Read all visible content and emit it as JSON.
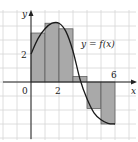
{
  "figure": {
    "curve_label": "y = f(x)",
    "x_axis_label": "x",
    "y_axis_label": "y",
    "origin_label": "0",
    "x_tick_labels": [
      {
        "value": 2,
        "text": "2"
      },
      {
        "value": 6,
        "text": "6"
      }
    ],
    "y_tick_labels": [
      {
        "value": 2,
        "text": "2"
      }
    ],
    "colors": {
      "grid": "#d6d6d6",
      "rect_fill": "#a9a9a9",
      "rect_stroke": "#555555",
      "curve": "#1a1a1a",
      "axis": "#222222"
    }
  },
  "chart_data": {
    "type": "area",
    "title": "",
    "xlabel": "x",
    "ylabel": "y",
    "xlim": [
      -2,
      7
    ],
    "ylim": [
      -4,
      5
    ],
    "grid": true,
    "grid_step": 1,
    "annotations": [
      {
        "text": "y = f(x)",
        "x": 3.5,
        "y": 2.8
      }
    ],
    "rectangles": [
      {
        "x0": 0,
        "x1": 1,
        "height": 3.5
      },
      {
        "x0": 1,
        "x1": 2,
        "height": 4.2
      },
      {
        "x0": 2,
        "x1": 3,
        "height": 3.8
      },
      {
        "x0": 3,
        "x1": 4,
        "height": 0.4
      },
      {
        "x0": 4,
        "x1": 5,
        "height": -1.9
      },
      {
        "x0": 5,
        "x1": 6,
        "height": -3.0
      }
    ],
    "curve": {
      "name": "y = f(x)",
      "x": [
        0,
        0.5,
        1,
        1.5,
        2,
        2.5,
        3,
        3.5,
        4,
        4.5,
        5,
        5.5,
        6
      ],
      "y": [
        2,
        3.1,
        3.8,
        4.2,
        4.2,
        3.6,
        2.2,
        0.2,
        -1.2,
        -2.2,
        -2.7,
        -2.95,
        -3.0
      ]
    }
  }
}
